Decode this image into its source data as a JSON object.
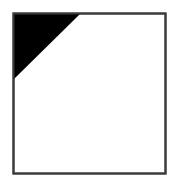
{
  "figure": {
    "canvas": {
      "width": 177,
      "height": 188,
      "background_color": "#ffffff"
    },
    "frame": {
      "name": "square-outline",
      "x": 13.5,
      "y": 13.5,
      "width": 152,
      "height": 160,
      "fill_color": "#ffffff",
      "stroke_color": "#3a3a3a",
      "stroke_width": 2
    },
    "triangle": {
      "name": "top-left-corner-triangle",
      "fill_color": "#000000",
      "description": "right triangle, right angle at top-left corner of square",
      "points": "14,14 80,14 14,79",
      "vertices": [
        {
          "label": "top-left-corner",
          "x": 14,
          "y": 14
        },
        {
          "label": "top-edge-point",
          "x": 80,
          "y": 14
        },
        {
          "label": "left-edge-point",
          "x": 14,
          "y": 79
        }
      ],
      "leg_top_length": 66,
      "leg_left_length": 65
    }
  }
}
